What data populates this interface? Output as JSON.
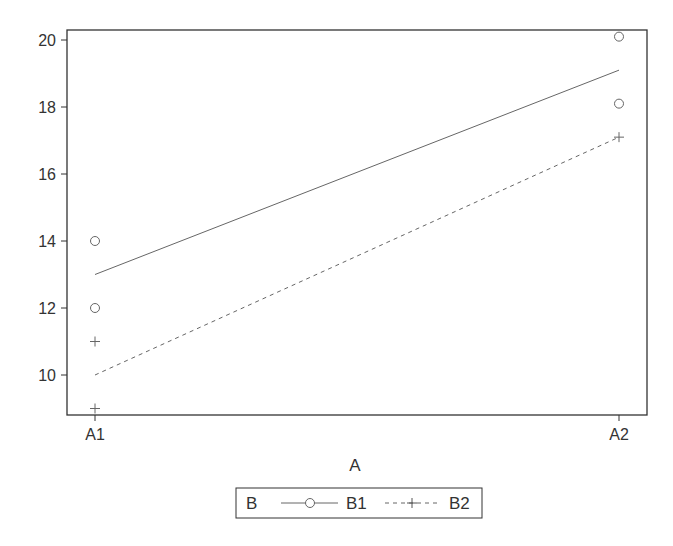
{
  "chart_data": {
    "type": "line",
    "title": "",
    "xlabel": "A",
    "ylabel": "",
    "categories": [
      "A1",
      "A2"
    ],
    "ylim": [
      8.8,
      20.3
    ],
    "yticks": [
      10,
      12,
      14,
      16,
      18,
      20
    ],
    "grid": false,
    "legend_position": "bottom",
    "legend_title": "B",
    "series": [
      {
        "name": "B1",
        "marker": "circle",
        "line_style": "solid",
        "fitted": [
          13,
          19.1
        ],
        "observations": [
          {
            "x": "A1",
            "y": 14
          },
          {
            "x": "A1",
            "y": 12
          },
          {
            "x": "A2",
            "y": 20.1
          },
          {
            "x": "A2",
            "y": 18.1
          }
        ]
      },
      {
        "name": "B2",
        "marker": "plus",
        "line_style": "dashed",
        "fitted": [
          10,
          17.1
        ],
        "observations": [
          {
            "x": "A1",
            "y": 11
          },
          {
            "x": "A1",
            "y": 9
          },
          {
            "x": "A2",
            "y": 17.1
          }
        ]
      }
    ]
  },
  "colors": {
    "axis": "#333333",
    "series_line": "#666666",
    "marker": "#666666"
  }
}
